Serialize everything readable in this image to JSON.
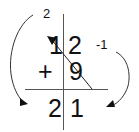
{
  "diagram": {
    "title": "",
    "operation": "addition",
    "rows": [
      {
        "operator": "",
        "tens": "1",
        "ones": "2"
      },
      {
        "operator": "+",
        "tens": "",
        "ones": "9"
      }
    ],
    "result": {
      "tens": "2",
      "ones": "1"
    },
    "annotations": {
      "left_label": "2",
      "right_label": "-1"
    },
    "colors": {
      "ink": "#111111",
      "line": "#555555",
      "background": "#ffffff"
    }
  }
}
